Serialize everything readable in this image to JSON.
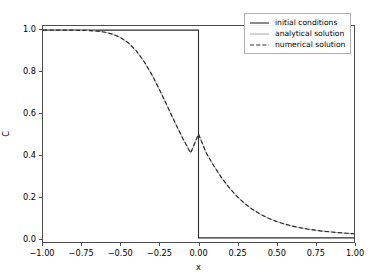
{
  "chart_data": {
    "type": "line",
    "title": "",
    "xlabel": "x",
    "ylabel": "C",
    "xlim": [
      -1.0,
      1.0
    ],
    "ylim": [
      -0.02,
      1.02
    ],
    "grid": false,
    "legend_position": "upper right",
    "xticks": [
      -1.0,
      -0.75,
      -0.5,
      -0.25,
      0.0,
      0.25,
      0.5,
      0.75,
      1.0
    ],
    "xticklabels": [
      "−1.00",
      "−0.75",
      "−0.50",
      "−0.25",
      "0.00",
      "0.25",
      "0.50",
      "0.75",
      "1.00"
    ],
    "yticks": [
      0.0,
      0.2,
      0.4,
      0.6,
      0.8,
      1.0
    ],
    "yticklabels": [
      "0.0",
      "0.2",
      "0.4",
      "0.6",
      "0.8",
      "1.0"
    ],
    "series": [
      {
        "name": "initial conditions",
        "style": "solid",
        "color": "#2b2b2b",
        "linewidth": 1.1,
        "x": [
          -1.0,
          -0.75,
          -0.5,
          -0.25,
          -0.02,
          0.0,
          0.0,
          0.02,
          0.25,
          0.5,
          0.75,
          1.0
        ],
        "values": [
          1.0,
          1.0,
          1.0,
          1.0,
          1.0,
          1.0,
          0.0,
          0.0,
          0.0,
          0.0,
          0.0,
          0.0
        ]
      },
      {
        "name": "analytical solution",
        "style": "solid",
        "color": "#a8a8a8",
        "linewidth": 1.0,
        "x": [
          -1.0,
          -0.95,
          -0.9,
          -0.85,
          -0.8,
          -0.75,
          -0.7,
          -0.65,
          -0.6,
          -0.55,
          -0.5,
          -0.45,
          -0.4,
          -0.35,
          -0.3,
          -0.25,
          -0.2,
          -0.15,
          -0.1,
          -0.05,
          0.0,
          0.05,
          0.1,
          0.15,
          0.2,
          0.25,
          0.3,
          0.35,
          0.4,
          0.45,
          0.5,
          0.55,
          0.6,
          0.65,
          0.7,
          0.75,
          0.8,
          0.85,
          0.9,
          0.95,
          1.0
        ],
        "values": [
          1.0,
          1.0,
          1.0,
          0.9999,
          0.9997,
          0.9992,
          0.998,
          0.9953,
          0.99,
          0.9804,
          0.9639,
          0.9379,
          0.9,
          0.8491,
          0.7857,
          0.7123,
          0.6332,
          0.5532,
          0.4772,
          0.4088,
          0.5,
          0.4088,
          0.3446,
          0.2877,
          0.2389,
          0.1977,
          0.1635,
          0.1355,
          0.1127,
          0.0943,
          0.0793,
          0.0672,
          0.0573,
          0.0492,
          0.0425,
          0.037,
          0.0323,
          0.0284,
          0.025,
          0.0221,
          0.0196
        ]
      },
      {
        "name": "numerical solution",
        "style": "dashed",
        "color": "#2b2b2b",
        "linewidth": 1.2,
        "x": [
          -1.0,
          -0.95,
          -0.9,
          -0.85,
          -0.8,
          -0.75,
          -0.7,
          -0.65,
          -0.6,
          -0.55,
          -0.5,
          -0.45,
          -0.4,
          -0.35,
          -0.3,
          -0.25,
          -0.2,
          -0.15,
          -0.1,
          -0.05,
          0.0,
          0.05,
          0.1,
          0.15,
          0.2,
          0.25,
          0.3,
          0.35,
          0.4,
          0.45,
          0.5,
          0.55,
          0.6,
          0.65,
          0.7,
          0.75,
          0.8,
          0.85,
          0.9,
          0.95,
          1.0
        ],
        "values": [
          1.0,
          1.0,
          1.0,
          0.9999,
          0.9997,
          0.9992,
          0.998,
          0.9953,
          0.99,
          0.9804,
          0.9639,
          0.9379,
          0.9,
          0.8491,
          0.7857,
          0.7123,
          0.6332,
          0.5532,
          0.4772,
          0.4088,
          0.5,
          0.4088,
          0.3446,
          0.2877,
          0.2389,
          0.1977,
          0.1635,
          0.1355,
          0.1127,
          0.0943,
          0.0793,
          0.0672,
          0.0573,
          0.0492,
          0.0425,
          0.037,
          0.0323,
          0.0284,
          0.025,
          0.0221,
          0.0196
        ]
      }
    ]
  }
}
